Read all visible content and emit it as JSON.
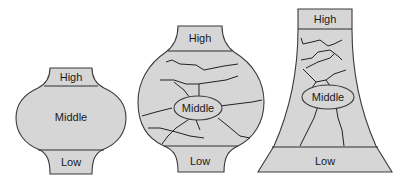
{
  "diagram": {
    "shapes": [
      {
        "id": "vase-1",
        "labels": {
          "high": "High",
          "middle": "Middle",
          "low": "Low"
        }
      },
      {
        "id": "vase-2",
        "labels": {
          "high": "High",
          "middle": "Middle",
          "low": "Low"
        }
      },
      {
        "id": "tower-3",
        "labels": {
          "high": "High",
          "middle": "Middle",
          "low": "Low"
        }
      }
    ],
    "colors": {
      "fill": "#d6d6d6",
      "stroke": "#3a3a3a",
      "background": "#ffffff"
    }
  }
}
